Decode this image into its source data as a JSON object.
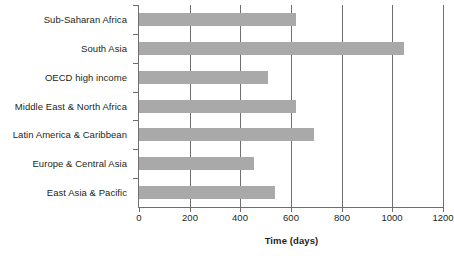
{
  "chart_data": {
    "type": "bar",
    "orientation": "horizontal",
    "title": "",
    "xlabel": "Time (days)",
    "ylabel": "",
    "xlim": [
      0,
      1200
    ],
    "xticks": [
      0,
      200,
      400,
      600,
      800,
      1000,
      1200
    ],
    "xtick_labels": [
      "0",
      "200",
      "400",
      "600",
      "800",
      "1000",
      "1200"
    ],
    "grid": "vertical",
    "legend": "none",
    "bar_color": "#a9a9a9",
    "axis_color": "#6f6f6f",
    "categories": [
      "Sub-Saharan Africa",
      "South Asia",
      "OECD high income",
      "Middle East & North Africa",
      "Latin America & Caribbean",
      "Europe & Central Asia",
      "East Asia & Pacific"
    ],
    "values": [
      620,
      1046,
      510,
      620,
      692,
      455,
      537
    ],
    "series": [
      {
        "name": "Time (days)",
        "values": [
          620,
          1046,
          510,
          620,
          692,
          455,
          537
        ]
      }
    ]
  }
}
